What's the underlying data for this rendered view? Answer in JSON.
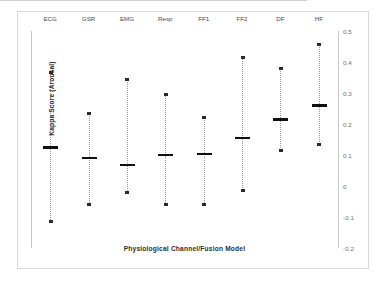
{
  "chart_data": {
    "type": "scatter",
    "title": "",
    "xlabel": "Physiological Channel/Fusion Model",
    "ylabel": "Kappa Score (Arousal)",
    "categories": [
      "ECG",
      "GSR",
      "EMG",
      "Resp",
      "FF1",
      "FF2",
      "DF",
      "HF"
    ],
    "ylim": [
      -0.2,
      0.5
    ],
    "yticks": [
      "0.5",
      "0.4",
      "0.3",
      "0.2",
      "0.1",
      "0",
      "-0.1",
      "-0.2"
    ],
    "ytick_values": [
      0.5,
      0.4,
      0.3,
      0.2,
      0.1,
      0,
      -0.1,
      -0.2
    ],
    "grid": false,
    "legend": "none",
    "zero_line": 0,
    "series": [
      {
        "name": "mean",
        "values": [
          0.125,
          0.09,
          0.068,
          0.1,
          0.103,
          0.155,
          0.215,
          0.26
        ]
      },
      {
        "name": "max",
        "values": [
          0.365,
          0.235,
          0.345,
          0.295,
          0.22,
          0.415,
          0.38,
          0.455
        ]
      },
      {
        "name": "min",
        "values": [
          -0.115,
          -0.06,
          -0.022,
          -0.06,
          -0.06,
          -0.013,
          0.115,
          0.135
        ]
      }
    ],
    "points": [
      {
        "category": "ECG",
        "mean": 0.125,
        "max": 0.365,
        "min": -0.115
      },
      {
        "category": "GSR",
        "mean": 0.09,
        "max": 0.235,
        "min": -0.06
      },
      {
        "category": "EMG",
        "mean": 0.068,
        "max": 0.345,
        "min": -0.022
      },
      {
        "category": "Resp",
        "mean": 0.1,
        "max": 0.295,
        "min": -0.06
      },
      {
        "category": "FF1",
        "mean": 0.103,
        "max": 0.22,
        "min": -0.06
      },
      {
        "category": "FF2",
        "mean": 0.155,
        "max": 0.415,
        "min": -0.013
      },
      {
        "category": "DF",
        "mean": 0.215,
        "max": 0.38,
        "min": 0.115
      },
      {
        "category": "HF",
        "mean": 0.26,
        "max": 0.455,
        "min": 0.135
      }
    ],
    "colors": {
      "marker": "#101010",
      "whisker": "#9a9a9a",
      "axis": "#c9c9c9",
      "zero_line": "#d0d0d0",
      "text": "#2e2e2e",
      "tick_text": "#6e6e6e",
      "background": "#ffffff"
    }
  }
}
